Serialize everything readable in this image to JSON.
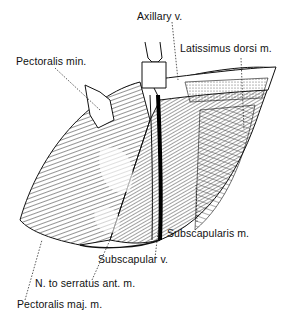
{
  "figure": {
    "type": "anatomical-illustration",
    "labels": {
      "axillary_v": "Axillary v.",
      "latissimus": "Latissimus dorsi m.",
      "pectoralis_min": "Pectoralis min.",
      "subscapularis": "Subscapularis m.",
      "subscapular_v": "Subscapular v.",
      "n_serratus": "N. to serratus ant. m.",
      "pectoralis_maj": "Pectoralis maj. m."
    }
  }
}
